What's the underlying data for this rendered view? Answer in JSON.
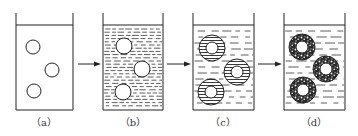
{
  "diagram": {
    "type": "process-sequence",
    "panels": [
      {
        "id": "a",
        "label": "（a）",
        "liquid": "none",
        "particles": "solid-circles",
        "x": 16,
        "w": 57,
        "label_x": 44,
        "items": [
          [
            33,
            47
          ],
          [
            52,
            70
          ],
          [
            34,
            91
          ]
        ]
      },
      {
        "id": "b",
        "label": "（b）",
        "liquid": "dense-dashes",
        "particles": "solid-circles",
        "x": 103,
        "w": 60,
        "label_x": 133,
        "items": [
          [
            124,
            46
          ],
          [
            142,
            69
          ],
          [
            123,
            92
          ]
        ]
      },
      {
        "id": "c",
        "label": "（c）",
        "liquid": "sparse-dashes",
        "particles": "striped-rings",
        "x": 193,
        "w": 61,
        "label_x": 223,
        "items": [
          [
            212,
            48
          ],
          [
            237,
            72
          ],
          [
            211,
            92
          ]
        ]
      },
      {
        "id": "d",
        "label": "（d）",
        "liquid": "sparse-dashes",
        "particles": "speckled-rings",
        "x": 284,
        "w": 61,
        "label_x": 314,
        "items": [
          [
            302,
            47
          ],
          [
            326,
            69
          ],
          [
            303,
            90
          ]
        ]
      }
    ],
    "arrows": [
      {
        "from": "a",
        "to": "b",
        "x1": 78,
        "x2": 100,
        "y": 64
      },
      {
        "from": "b",
        "to": "c",
        "x1": 167,
        "x2": 190,
        "y": 64
      },
      {
        "from": "c",
        "to": "d",
        "x1": 258,
        "x2": 281,
        "y": 64
      }
    ],
    "colors": {
      "stroke": "#222222",
      "background": "#ffffff"
    }
  }
}
